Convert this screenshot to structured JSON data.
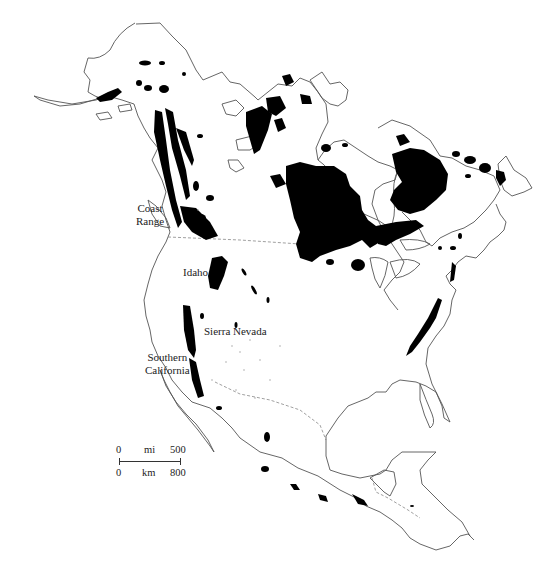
{
  "map": {
    "subject": "North America",
    "fill_color": "#000000",
    "outline_color": "#555555",
    "background": "#ffffff",
    "labels": {
      "coast_range_line1": "Coast",
      "coast_range_line2": "Range",
      "idaho": "Idaho",
      "sierra_nevada": "Sierra Nevada",
      "southern_california_line1": "Southern",
      "southern_california_line2": "California"
    },
    "scale_bar": {
      "mi_start": "0",
      "mi_unit": "mi",
      "mi_end": "500",
      "km_start": "0",
      "km_unit": "km",
      "km_end": "800"
    }
  }
}
